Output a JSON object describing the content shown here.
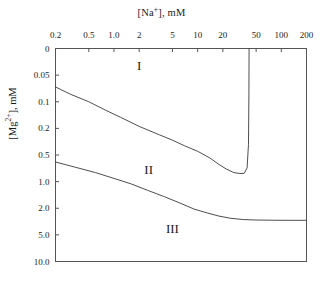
{
  "chart_data": {
    "type": "line",
    "title": "",
    "xlabel": "[Na+], mM",
    "ylabel": "[Mg2+], mM",
    "xlabel_parts": {
      "pre": "[Na",
      "sup": "+",
      "post": "], mM"
    },
    "ylabel_parts": {
      "pre": "[Mg",
      "sup": "2+",
      "post": "], mM"
    },
    "xscale": "log",
    "yscale": "log-like",
    "grid": false,
    "legend": null,
    "xlim": [
      0.2,
      200
    ],
    "ylim": [
      0,
      10.0
    ],
    "xticks": [
      "0.2",
      "0.5",
      "1.0",
      "2",
      "5",
      "10",
      "20",
      "50",
      "100",
      "200"
    ],
    "xtick_values": [
      0.2,
      0.5,
      1.0,
      2,
      5,
      10,
      20,
      50,
      100,
      200
    ],
    "yticks": [
      "0",
      "0.05",
      "0.1",
      "0.2",
      "0.5",
      "1.0",
      "2.0",
      "5.0",
      "10.0"
    ],
    "ytick_values": [
      0,
      0.05,
      0.1,
      0.2,
      0.5,
      1.0,
      2.0,
      5.0,
      10.0
    ],
    "annotations": [
      {
        "text": "I",
        "x": 2.0,
        "y": 0.035,
        "region": "region-1"
      },
      {
        "text": "II",
        "x": 2.6,
        "y": 0.75,
        "region": "region-2"
      },
      {
        "text": "III",
        "x": 5.0,
        "y": 4.2,
        "region": "region-3"
      }
    ],
    "series": [
      {
        "name": "boundary-I-II",
        "points": [
          [
            0.2,
            0.068
          ],
          [
            0.3,
            0.082
          ],
          [
            0.5,
            0.1
          ],
          [
            0.8,
            0.125
          ],
          [
            1.2,
            0.15
          ],
          [
            2.0,
            0.19
          ],
          [
            3.5,
            0.25
          ],
          [
            5.0,
            0.3
          ],
          [
            7.0,
            0.365
          ],
          [
            10.0,
            0.44
          ],
          [
            14.0,
            0.54
          ],
          [
            18.0,
            0.64
          ],
          [
            22.0,
            0.72
          ],
          [
            27.0,
            0.79
          ],
          [
            32.0,
            0.81
          ],
          [
            36.0,
            0.805
          ],
          [
            39.0,
            0.7
          ],
          [
            40.5,
            0.35
          ],
          [
            41.0,
            0.08
          ],
          [
            41.2,
            0.0
          ]
        ]
      },
      {
        "name": "boundary-II-III",
        "points": [
          [
            0.2,
            0.6
          ],
          [
            0.35,
            0.69
          ],
          [
            0.6,
            0.79
          ],
          [
            1.0,
            0.92
          ],
          [
            1.6,
            1.06
          ],
          [
            2.5,
            1.25
          ],
          [
            4.0,
            1.48
          ],
          [
            6.0,
            1.73
          ],
          [
            9.0,
            2.05
          ],
          [
            13.0,
            2.35
          ],
          [
            18.0,
            2.62
          ],
          [
            25.0,
            2.83
          ],
          [
            35.0,
            2.95
          ],
          [
            50.0,
            3.0
          ],
          [
            80.0,
            3.02
          ],
          [
            130.0,
            3.03
          ],
          [
            200.0,
            3.03
          ]
        ]
      }
    ]
  }
}
